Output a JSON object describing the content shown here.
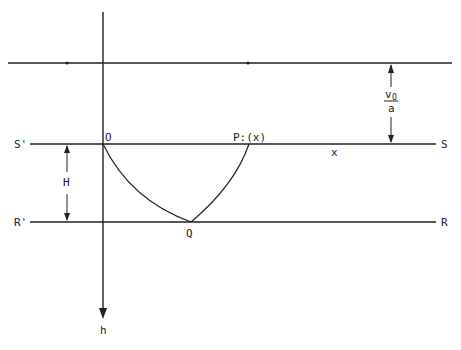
{
  "diagram": {
    "labels": {
      "origin": "O",
      "point_p": "P:(x)",
      "point_q": "Q",
      "x_label": "x",
      "s_prime": "S'",
      "s": "S",
      "r_prime": "R'",
      "r": "R",
      "height": "H",
      "axis_h": "h",
      "v0_numerator": "v",
      "v0_subscript": "O",
      "v0_denominator": "a"
    },
    "colors": {
      "line": "#222222",
      "background": "#ffffff"
    }
  }
}
